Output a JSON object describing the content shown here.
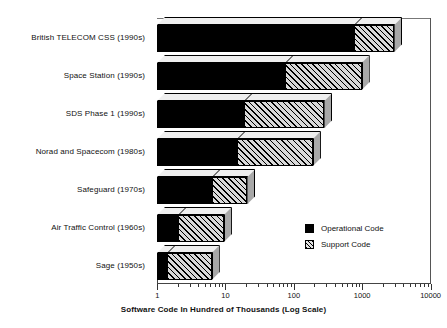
{
  "chart_data": {
    "type": "bar",
    "orientation": "horizontal",
    "stacked": true,
    "title": "",
    "xlabel": "Software Code In Hundred of Thousands (Log Scale)",
    "ylabel": "",
    "xscale": "log",
    "xlim": [
      1,
      10000
    ],
    "xticks": [
      1,
      10,
      100,
      1000,
      10000
    ],
    "xticklabels": [
      "1",
      "10",
      "100",
      "1000",
      "10000"
    ],
    "grid": false,
    "legend_position": "inside-lower-right",
    "categories": [
      "British TELECOM CSS (1990s)",
      "Space Station (1990s)",
      "SDS Phase 1 (1990s)",
      "Norad and Spacecom (1980s)",
      "Safeguard (1970s)",
      "Air Traffic Control (1960s)",
      "Sage (1950s)"
    ],
    "series": [
      {
        "name": "Operational Code",
        "color": "#000000",
        "pattern": "solid",
        "values": [
          760,
          74,
          19,
          15,
          6.3,
          2.0,
          1.4
        ]
      },
      {
        "name": "Support Code",
        "color": "#d9d9d9",
        "pattern": "diagonal-hatch",
        "values": [
          2950,
          980,
          280,
          190,
          21,
          9.5,
          6.3
        ]
      }
    ],
    "bars": [
      {
        "category": "British TELECOM CSS (1990s)",
        "operational_end": 760,
        "total_end": 2950
      },
      {
        "category": "Space Station (1990s)",
        "operational_end": 74,
        "total_end": 980
      },
      {
        "category": "SDS Phase 1 (1990s)",
        "operational_end": 19,
        "total_end": 280
      },
      {
        "category": "Norad and Spacecom (1980s)",
        "operational_end": 15,
        "total_end": 190
      },
      {
        "category": "Safeguard (1970s)",
        "operational_end": 6.3,
        "total_end": 21
      },
      {
        "category": "Air Traffic Control (1960s)",
        "operational_end": 2.0,
        "total_end": 9.5
      },
      {
        "category": "Sage (1950s)",
        "operational_end": 1.4,
        "total_end": 6.3
      }
    ]
  },
  "legend": {
    "items": [
      {
        "label": "Operational Code",
        "swatch": "solid-black"
      },
      {
        "label": "Support Code",
        "swatch": "hatched"
      }
    ]
  },
  "axis": {
    "x_title": "Software Code In Hundred of Thousands (Log Scale)",
    "tick_labels": [
      "1",
      "10",
      "100",
      "1000",
      "10000"
    ]
  }
}
